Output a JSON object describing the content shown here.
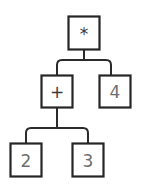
{
  "diagram": {
    "background_color": "#ffffff",
    "node_border_color": "#262626",
    "node_fill_color": "#ffffff",
    "edge_color": "#2b2b2b",
    "operator_text_color": "#3a3a3a",
    "number_text_color": "#6e6e6e"
  },
  "nodes": {
    "root": {
      "label": "*",
      "kind": "operator"
    },
    "left": {
      "label": "+",
      "kind": "operator"
    },
    "right": {
      "label": "4",
      "kind": "number"
    },
    "left_left": {
      "label": "2",
      "kind": "number"
    },
    "left_right": {
      "label": "3",
      "kind": "number"
    }
  }
}
